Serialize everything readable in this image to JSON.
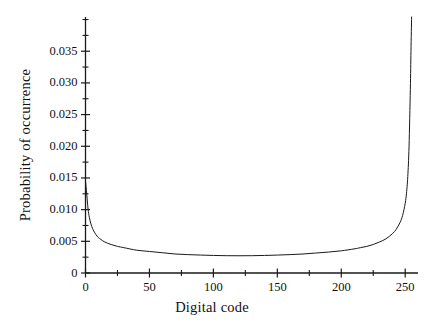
{
  "chart_data": {
    "type": "line",
    "title": "",
    "subtitle": "",
    "xlabel": "Digital code",
    "ylabel": "Probability of occurrence",
    "xlim": [
      0,
      260
    ],
    "ylim": [
      0,
      0.0404
    ],
    "grid": false,
    "legend": null,
    "annotations": [],
    "x_ticks_major": [
      0,
      50,
      100,
      150,
      200,
      250
    ],
    "x_tick_labels": [
      "0",
      "50",
      "100",
      "150",
      "200",
      "250"
    ],
    "x_ticks_minor": [
      25,
      75,
      125,
      175,
      225
    ],
    "y_ticks_major": [
      0,
      0.005,
      0.01,
      0.015,
      0.02,
      0.025,
      0.03,
      0.035
    ],
    "y_tick_labels": [
      "0",
      "0.005",
      "0.010",
      "0.015",
      "0.020",
      "0.025",
      "0.030",
      "0.035"
    ],
    "y_ticks_minor": [
      0.0025,
      0.0075,
      0.0125,
      0.0175,
      0.0225,
      0.0275,
      0.0325,
      0.0375
    ],
    "line_color": "#1a1a1a",
    "line_width": 1.0,
    "series": [
      {
        "name": "Probability of occurrence",
        "x": [
          0,
          1,
          2,
          3,
          4,
          5,
          6,
          8,
          10,
          12,
          15,
          20,
          25,
          30,
          40,
          50,
          60,
          70,
          80,
          90,
          100,
          110,
          120,
          130,
          140,
          150,
          160,
          170,
          180,
          190,
          200,
          210,
          215,
          220,
          225,
          230,
          235,
          240,
          243,
          246,
          248,
          250,
          251,
          252,
          253,
          254,
          254.5,
          255
        ],
        "y": [
          0.0145,
          0.0124,
          0.0101,
          0.0088,
          0.0079,
          0.0073,
          0.0068,
          0.0061,
          0.0056,
          0.0053,
          0.0049,
          0.0045,
          0.0042,
          0.004,
          0.0036,
          0.0034,
          0.0032,
          0.003,
          0.0029,
          0.00283,
          0.00277,
          0.00273,
          0.00272,
          0.00273,
          0.00277,
          0.00283,
          0.0029,
          0.003,
          0.00315,
          0.0033,
          0.0035,
          0.0038,
          0.004,
          0.0042,
          0.0045,
          0.0049,
          0.0054,
          0.0062,
          0.0069,
          0.008,
          0.0091,
          0.011,
          0.0126,
          0.0152,
          0.02,
          0.029,
          0.035,
          0.0404
        ]
      }
    ]
  },
  "axes": {
    "y_axis_name": "y-axis",
    "x_axis_name": "x-axis"
  }
}
